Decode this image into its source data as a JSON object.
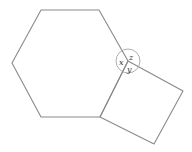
{
  "diagram": {
    "type": "geometry",
    "shapes": [
      {
        "name": "regular-hexagon",
        "vertices": [
          [
            41,
            10
          ],
          [
            99,
            10
          ],
          [
            128,
            61
          ],
          [
            100,
            117
          ],
          [
            41,
            117
          ],
          [
            12,
            63
          ]
        ]
      },
      {
        "name": "square",
        "vertices": [
          [
            128,
            61
          ],
          [
            183,
            91
          ],
          [
            154,
            144
          ],
          [
            100,
            117
          ]
        ]
      }
    ],
    "shared_vertex": [
      128,
      61
    ],
    "angle_circle_radius": 12,
    "angle_labels": {
      "x": "x",
      "y": "y",
      "z": "z"
    },
    "colors": {
      "stroke": "#8a8a8a",
      "circle": "#9a9a9a",
      "label": "#333333"
    }
  }
}
